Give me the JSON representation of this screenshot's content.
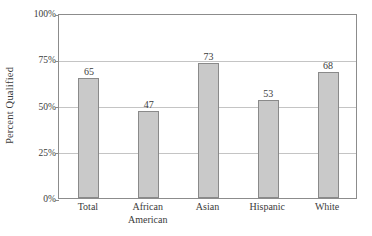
{
  "chart_data": {
    "type": "bar",
    "title": "",
    "xlabel": "",
    "ylabel": "Percent Qualified",
    "categories": [
      "Total",
      "African American",
      "Asian",
      "Hispanic",
      "White"
    ],
    "category_lines": [
      [
        "Total"
      ],
      [
        "African",
        "American"
      ],
      [
        "Asian"
      ],
      [
        "Hispanic"
      ],
      [
        "White"
      ]
    ],
    "values": [
      65,
      47,
      73,
      53,
      68
    ],
    "value_labels": [
      "65",
      "47",
      "73",
      "53",
      "68"
    ],
    "ylim": [
      0,
      100
    ],
    "yticks": [
      0,
      25,
      50,
      75,
      100
    ],
    "ytick_labels": [
      "0%",
      "25%",
      "50%",
      "75%",
      "100%"
    ],
    "grid": true,
    "legend": "none",
    "colors": {
      "bar_fill": "#c9c9c9",
      "bar_border": "#8a8a8a",
      "gridline": "#c4c4c4",
      "frame": "#8c8c8c",
      "text": "#3b3b3b",
      "background": "#ffffff"
    }
  }
}
